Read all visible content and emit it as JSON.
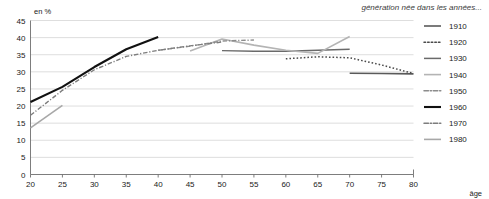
{
  "chart_data": {
    "type": "line",
    "title": "génération née dans les années...",
    "ylabel": "en %",
    "xlabel": "âge",
    "xlim": [
      20,
      80
    ],
    "ylim": [
      0,
      45
    ],
    "xticks": [
      20,
      25,
      30,
      35,
      40,
      45,
      50,
      55,
      60,
      65,
      70,
      75,
      80
    ],
    "yticks": [
      0,
      5,
      10,
      15,
      20,
      25,
      30,
      35,
      40,
      45
    ],
    "grid": true,
    "legend_position": "right",
    "series": [
      {
        "name": "1910",
        "style": "solid",
        "color": "#5a5a5a",
        "width": 1.6,
        "x": [
          70,
          75,
          80
        ],
        "values": [
          29.6,
          29.5,
          29.4
        ]
      },
      {
        "name": "1920",
        "style": "dotted",
        "color": "#4a4a4a",
        "width": 1.5,
        "x": [
          60,
          65,
          70,
          75,
          80
        ],
        "values": [
          33.8,
          34.4,
          34.1,
          32.0,
          29.5
        ]
      },
      {
        "name": "1930",
        "style": "solid",
        "color": "#6a6a6a",
        "width": 1.4,
        "x": [
          50,
          55,
          60,
          65,
          70
        ],
        "values": [
          36.2,
          36.0,
          36.0,
          36.3,
          36.6
        ]
      },
      {
        "name": "1940",
        "style": "solid",
        "color": "#b4b4b4",
        "width": 1.6,
        "x": [
          45,
          50,
          55,
          60,
          65,
          70
        ],
        "values": [
          36.1,
          39.6,
          37.8,
          36.3,
          35.4,
          40.3
        ]
      },
      {
        "name": "1950",
        "style": "dashdot",
        "color": "#8c8c8c",
        "width": 1.4,
        "x": [
          40,
          45,
          50,
          55
        ],
        "values": [
          36.3,
          37.5,
          39.0,
          39.3
        ]
      },
      {
        "name": "1960",
        "style": "solid",
        "color": "#111111",
        "width": 2.1,
        "x": [
          20,
          25,
          30,
          35,
          40
        ],
        "values": [
          21.2,
          25.6,
          31.4,
          36.6,
          40.2
        ]
      },
      {
        "name": "1970",
        "style": "dashdot",
        "color": "#7d7d7d",
        "width": 1.4,
        "x": [
          20,
          25,
          30,
          35,
          40,
          45,
          50
        ],
        "values": [
          17.3,
          24.6,
          30.6,
          34.5,
          36.3,
          37.6,
          38.7
        ]
      },
      {
        "name": "1980",
        "style": "solid",
        "color": "#a8a8a8",
        "width": 1.6,
        "x": [
          20,
          25
        ],
        "values": [
          13.6,
          20.2
        ]
      }
    ]
  },
  "legend": {
    "entries": [
      {
        "label": "1910"
      },
      {
        "label": "1920"
      },
      {
        "label": "1930"
      },
      {
        "label": "1940"
      },
      {
        "label": "1950"
      },
      {
        "label": "1960"
      },
      {
        "label": "1970"
      },
      {
        "label": "1980"
      }
    ]
  }
}
